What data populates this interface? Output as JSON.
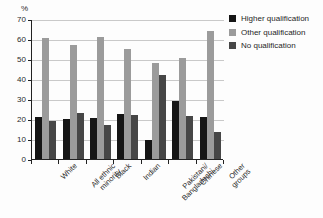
{
  "chart_data": {
    "type": "bar",
    "title": "",
    "xlabel": "",
    "ylabel": "%",
    "ylim": [
      0,
      70
    ],
    "yticks": [
      0,
      10,
      20,
      30,
      40,
      50,
      60,
      70
    ],
    "grid": true,
    "legend_position": "right",
    "categories": [
      "White",
      "All ethnic\nminority",
      "Black",
      "Indian",
      "Pakistani/\nBangladeshi",
      "Chinese",
      "Other\ngroups"
    ],
    "series": [
      {
        "name": "Higher qualification",
        "color": "#151515",
        "values": [
          21,
          20,
          20.5,
          22.5,
          9.5,
          29,
          21
        ]
      },
      {
        "name": "Other qualification",
        "color": "#9b9b9b",
        "values": [
          60.5,
          57,
          61,
          55,
          48,
          50.5,
          64
        ]
      },
      {
        "name": "No qualification",
        "color": "#464646",
        "values": [
          19,
          23,
          17,
          22,
          42,
          21.5,
          13.5
        ]
      }
    ]
  },
  "axis": {
    "percent_symbol": "%",
    "tick_labels": [
      "70",
      "60",
      "50",
      "40",
      "30",
      "20",
      "10",
      "0"
    ]
  },
  "legend": {
    "items": [
      {
        "label": "Higher qualification",
        "color": "#151515"
      },
      {
        "label": "Other qualification",
        "color": "#9b9b9b"
      },
      {
        "label": "No qualification",
        "color": "#464646"
      }
    ]
  }
}
